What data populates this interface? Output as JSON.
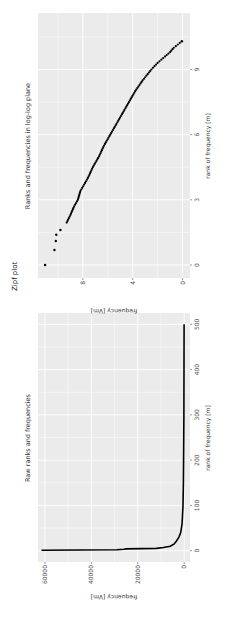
{
  "page": {
    "section_label": "Zipf plot"
  },
  "chart_data": [
    {
      "type": "line",
      "title": "Raw ranks and frequencies",
      "xlabel": "rank of frequency [m]",
      "ylabel": "frequency [Vm]",
      "xlim": [
        -25,
        525
      ],
      "ylim": [
        -2500,
        63000
      ],
      "xticks": [
        0,
        100,
        200,
        300,
        400,
        500
      ],
      "yticks": [
        0,
        20000,
        40000,
        60000
      ],
      "grid": true,
      "background": "#ebebeb",
      "x": [
        1,
        2,
        3,
        4,
        5,
        7,
        10,
        15,
        20,
        30,
        40,
        60,
        100,
        150,
        200,
        300,
        400,
        500
      ],
      "values": [
        61500,
        29000,
        26000,
        25000,
        12000,
        9000,
        6000,
        4300,
        3500,
        2300,
        1500,
        900,
        500,
        350,
        250,
        150,
        100,
        60
      ]
    },
    {
      "type": "scatter",
      "title": "Ranks and frequencies in log-log plane",
      "xlabel": "rank of frequency [m]",
      "ylabel": "frequency [Vm]",
      "xlim": [
        -0.6,
        11.6
      ],
      "ylim": [
        -0.6,
        11.6
      ],
      "xticks": [
        0,
        3,
        6,
        9
      ],
      "yticks": [
        0,
        4,
        8
      ],
      "grid": true,
      "background": "#ebebeb",
      "x": [
        0.0,
        0.69,
        1.1,
        1.39,
        1.61,
        1.95,
        2.3,
        2.7,
        3.0,
        3.4,
        3.7,
        4.0,
        4.5,
        5.0,
        5.5,
        6.0,
        6.5,
        7.0,
        7.5,
        8.0,
        8.5,
        9.0,
        9.3,
        9.6,
        9.8,
        10.0,
        10.3
      ],
      "values": [
        11.03,
        10.28,
        10.17,
        10.13,
        9.8,
        9.3,
        9.0,
        8.7,
        8.4,
        8.2,
        7.9,
        7.6,
        7.2,
        6.7,
        6.3,
        5.8,
        5.3,
        4.8,
        4.3,
        3.8,
        3.2,
        2.5,
        2.0,
        1.4,
        1.0,
        0.7,
        0.05
      ]
    }
  ]
}
